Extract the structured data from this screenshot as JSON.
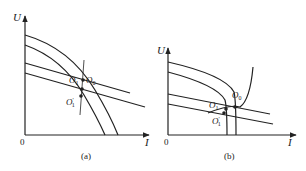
{
  "figure": {
    "panels": [
      {
        "id": "a",
        "caption": "(a)",
        "axes": {
          "y_label": "U",
          "x_label": "I",
          "origin_label": "0"
        },
        "points": [
          {
            "name": "O",
            "sub": "0",
            "prime": ""
          },
          {
            "name": "O",
            "sub": "1",
            "prime": ""
          },
          {
            "name": "O",
            "sub": "1",
            "prime": "′"
          }
        ]
      },
      {
        "id": "b",
        "caption": "(b)",
        "axes": {
          "y_label": "U",
          "x_label": "I",
          "origin_label": "0"
        },
        "points": [
          {
            "name": "O",
            "sub": "0",
            "prime": ""
          },
          {
            "name": "O",
            "sub": "1",
            "prime": ""
          },
          {
            "name": "O",
            "sub": "1",
            "prime": "′"
          }
        ]
      }
    ]
  }
}
